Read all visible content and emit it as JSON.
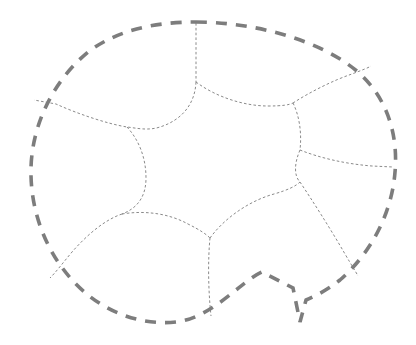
{
  "canvas": {
    "width": 416,
    "height": 345,
    "background_color": "#ffffff",
    "title": "Partitioned blob domain with dashed boundary and interior cell curves"
  },
  "style": {
    "outer_stroke_color": "#7d7d7d",
    "outer_stroke_width": 3.6,
    "outer_dash_pattern": "11 9",
    "interior_stroke_color": "#8a8a8a",
    "interior_stroke_width": 1.0,
    "interior_dash_pattern": "2.6 2.2"
  },
  "shapes": {
    "outer_boundary": {
      "label": "outer-dashed-boundary",
      "description": "Closed rounded blob outline with a V-shaped notch at lower right",
      "path": "M 196 22 C 250 22 318 38 358 72 C 390 100 398 140 395 172 C 392 212 372 252 340 280 C 330 288 318 295 306 300 L 300 322 L 293 288 L 262 272 C 240 282 212 318 176 322 C 138 326 100 310 74 282 C 44 250 30 208 31 168 C 32 126 52 82 88 52 C 120 28 160 22 196 22 Z"
    },
    "interior_curves": [
      {
        "label": "curve-top-center-to-boundary",
        "description": "From top boundary near x=196 down to central junction",
        "path": "M 196 23 C 196 45 196 66 196 82"
      },
      {
        "label": "curve-top-left-lobe",
        "description": "From central junction sweeping left and down to the left boundary",
        "path": "M 196 82 C 195 104 182 120 160 127 C 148 131 136 128 127 127 C 108 124 78 114 56 104 L 34 100"
      },
      {
        "label": "curve-left-vertical",
        "description": "From the left junction curving down to bottom-left junction",
        "path": "M 127 127 C 139 140 146 158 146 178 C 146 196 138 208 122 214"
      },
      {
        "label": "curve-bottom-left-lobe",
        "description": "From bottom-left junction out to the lower-left boundary",
        "path": "M 122 214 C 104 220 86 236 72 252 C 62 264 56 272 50 278"
      },
      {
        "label": "curve-bottom-center-lobe",
        "description": "From bottom-left junction arcing right to bottom-center junction",
        "path": "M 122 214 C 146 210 170 214 188 224 C 200 230 206 234 210 238"
      },
      {
        "label": "curve-bottom-vertical",
        "description": "From bottom-center junction down to the bottom boundary",
        "path": "M 210 238 C 208 258 208 288 211 316"
      },
      {
        "label": "curve-lower-right-lobe",
        "description": "From bottom-center junction sweeping right toward lower-right notch",
        "path": "M 210 238 C 226 216 252 200 274 194 C 288 190 296 186 300 182"
      },
      {
        "label": "curve-right-lower-vertical",
        "description": "From right-middle junction down to the lower-right boundary near the notch",
        "path": "M 300 150 C 294 164 294 176 300 182 C 312 200 330 228 345 254 C 352 266 356 272 358 276"
      },
      {
        "label": "curve-right-middle-horizontal",
        "description": "From right-middle junction arcing right to the right boundary",
        "path": "M 300 150 C 320 158 346 164 372 166 L 393 167"
      },
      {
        "label": "curve-right-upper-vertical",
        "description": "From upper-right junction down to right-middle junction",
        "path": "M 293 103 C 299 115 302 132 300 150"
      },
      {
        "label": "curve-upper-right-lobe",
        "description": "From upper-right junction up-right to the top-right boundary",
        "path": "M 293 103 C 310 92 334 80 352 74 C 362 70 368 68 371 66"
      },
      {
        "label": "curve-upper-center-lobe",
        "description": "From central top junction arcing right to upper-right junction",
        "path": "M 196 82 C 216 97 244 106 268 106 C 282 106 289 105 293 103"
      }
    ]
  },
  "junctions": [
    {
      "label": "junction-top-center",
      "x": 196,
      "y": 82
    },
    {
      "label": "junction-left",
      "x": 127,
      "y": 127
    },
    {
      "label": "junction-bottom-left",
      "x": 122,
      "y": 214
    },
    {
      "label": "junction-bottom-center",
      "x": 210,
      "y": 238
    },
    {
      "label": "junction-right-middle",
      "x": 300,
      "y": 150
    },
    {
      "label": "junction-upper-right",
      "x": 293,
      "y": 103
    }
  ],
  "regions": [
    {
      "label": "central-star-cell"
    },
    {
      "label": "top-left-cell"
    },
    {
      "label": "top-right-cell"
    },
    {
      "label": "left-cell"
    },
    {
      "label": "right-cell"
    },
    {
      "label": "bottom-left-cell"
    },
    {
      "label": "bottom-center-cell"
    },
    {
      "label": "bottom-right-cell"
    }
  ]
}
